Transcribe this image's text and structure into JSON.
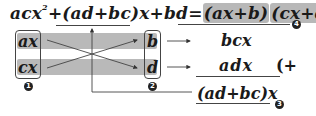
{
  "equation": {
    "lhs_part1": "acx",
    "exponent": "2",
    "lhs_part2": "+",
    "middle_term": "(ad+bc)x",
    "lhs_part3": "+bd",
    "equals": "=",
    "factor1": "(ax+b)",
    "factor2": "(cx+d)"
  },
  "left_column": {
    "top": "ax",
    "bottom": "cx",
    "label": "1"
  },
  "right_column": {
    "top": "b",
    "bottom": "d",
    "label": "2"
  },
  "products": {
    "top": "bcx",
    "bottom": "adx",
    "plus_sign": "(+"
  },
  "sum": {
    "value": "(ad+bc)x",
    "label": "3"
  },
  "result_label": "4",
  "colors": {
    "band": "#b9b9b9",
    "line": "#444444",
    "text": "#1a1a1a",
    "badge": "#222222"
  }
}
